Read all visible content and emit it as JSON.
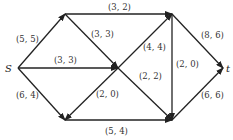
{
  "diagram": {
    "type": "flow-network",
    "nodes": {
      "s": {
        "label": "S",
        "x": 18,
        "y": 68
      },
      "a": {
        "label": "",
        "x": 65,
        "y": 14
      },
      "b": {
        "label": "",
        "x": 172,
        "y": 14
      },
      "c": {
        "label": "",
        "x": 118,
        "y": 68
      },
      "d": {
        "label": "",
        "x": 65,
        "y": 120
      },
      "e": {
        "label": "",
        "x": 172,
        "y": 120
      },
      "t": {
        "label": "t",
        "x": 223,
        "y": 68
      }
    },
    "edges": [
      {
        "from": "s",
        "to": "a",
        "label": "(5, 5)"
      },
      {
        "from": "a",
        "to": "b",
        "label": "(3, 2)"
      },
      {
        "from": "a",
        "to": "c",
        "label": "(3, 3)"
      },
      {
        "from": "s",
        "to": "c",
        "label": "(3, 3)"
      },
      {
        "from": "s",
        "to": "d",
        "label": "(6, 4)"
      },
      {
        "from": "c",
        "to": "b",
        "label": "(4, 4)"
      },
      {
        "from": "c",
        "to": "e",
        "label": "(2, 2)"
      },
      {
        "from": "c",
        "to": "d",
        "label": "(2, 0)"
      },
      {
        "from": "b",
        "to": "e",
        "label": "(2, 0)"
      },
      {
        "from": "b",
        "to": "t",
        "label": "(8, 6)"
      },
      {
        "from": "d",
        "to": "e",
        "label": "(5, 4)"
      },
      {
        "from": "e",
        "to": "t",
        "label": "(6, 6)"
      }
    ]
  }
}
